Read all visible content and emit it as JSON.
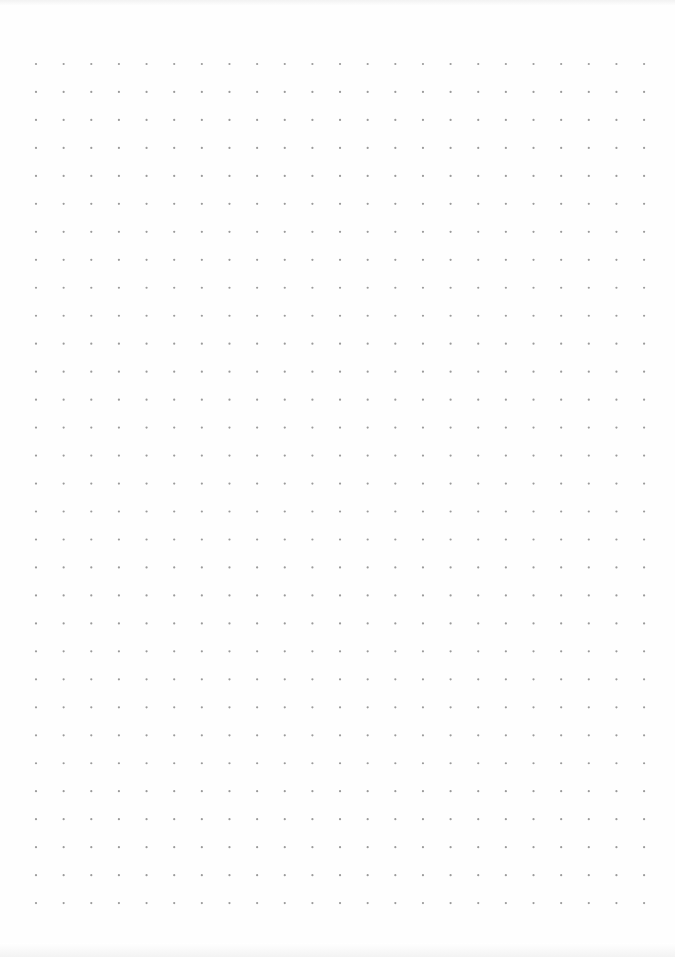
{
  "page": {
    "type": "dot-grid-paper",
    "background": "#fefefe",
    "dot_color": "#9a9a9a",
    "dot_radius": 1.1
  },
  "grid": {
    "columns": 23,
    "rows": 31,
    "origin_x": 36,
    "origin_y": 64,
    "spacing_x": 27.64,
    "spacing_y": 27.97
  }
}
